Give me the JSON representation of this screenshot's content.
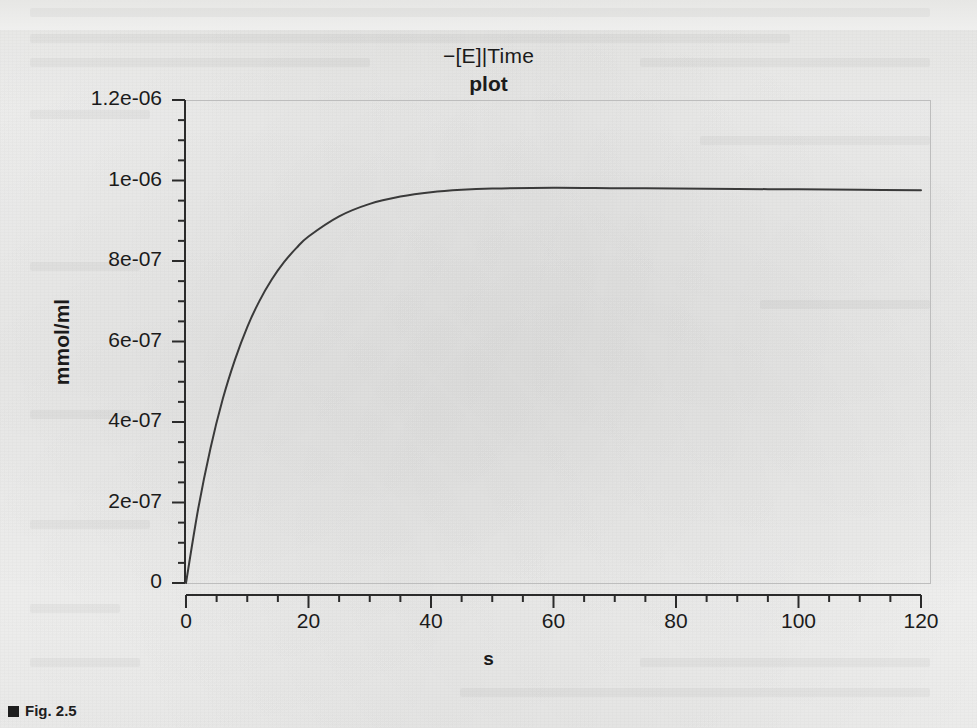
{
  "figure": {
    "title_expression": "−[E]|Time",
    "title_plot": "plot",
    "caption": "Fig. 2.5"
  },
  "chart_data": {
    "type": "line",
    "title": "−[E]|Time plot",
    "xlabel": "s",
    "ylabel": "mmol/ml",
    "xlim": [
      0,
      120
    ],
    "ylim": [
      0,
      1.2e-06
    ],
    "grid": false,
    "legend": "none",
    "x_major_ticks": [
      0,
      20,
      40,
      60,
      80,
      100,
      120
    ],
    "x_tick_labels": [
      "0",
      "20",
      "40",
      "60",
      "80",
      "100",
      "120"
    ],
    "x_minor_step": 5,
    "y_major_ticks": [
      0,
      2e-07,
      4e-07,
      6e-07,
      8e-07,
      1e-06,
      1.2e-06
    ],
    "y_tick_labels": [
      "0",
      "2e-07",
      "4e-07",
      "6e-07",
      "8e-07",
      "1e-06",
      "1.2e-06"
    ],
    "y_minor_step": 5e-08,
    "line_color": "#3a3a3a",
    "series": [
      {
        "name": "−[E]",
        "x": [
          0,
          2,
          4,
          6,
          8,
          10,
          12,
          14,
          16,
          18,
          20,
          25,
          30,
          35,
          40,
          45,
          50,
          60,
          70,
          80,
          90,
          100,
          110,
          120
        ],
        "y": [
          0.0,
          1.85e-07,
          3.35e-07,
          4.57e-07,
          5.55e-07,
          6.36e-07,
          7.01e-07,
          7.54e-07,
          7.97e-07,
          8.32e-07,
          8.61e-07,
          9.11e-07,
          9.42e-07,
          9.6e-07,
          9.71e-07,
          9.77e-07,
          9.8e-07,
          9.82e-07,
          9.81e-07,
          9.8e-07,
          9.79e-07,
          9.78e-07,
          9.77e-07,
          9.76e-07
        ]
      }
    ]
  }
}
